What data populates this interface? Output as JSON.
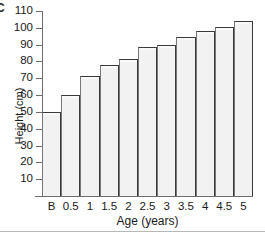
{
  "figure": {
    "panel_letter": "C",
    "background_color": "#ffffff"
  },
  "chart_data": {
    "type": "bar",
    "title": "",
    "xlabel": "Age (years)",
    "ylabel": "Height (cm)",
    "categories": [
      "B",
      "0.5",
      "1",
      "1.5",
      "2",
      "2.5",
      "3",
      "3.5",
      "4",
      "4.5",
      "5"
    ],
    "values": [
      50,
      60,
      71.5,
      78,
      81.5,
      88.5,
      89.5,
      94.5,
      98,
      100.5,
      104
    ],
    "ylim": [
      0,
      110
    ],
    "ytick_labels": [
      "110",
      "100",
      "90",
      "80",
      "70",
      "60",
      "50",
      "40",
      "30",
      "20",
      "10"
    ],
    "ytick_values": [
      110,
      100,
      90,
      80,
      70,
      60,
      50,
      40,
      30,
      20,
      10
    ],
    "grid": false,
    "legend": null,
    "bar_fill_color": "#f2f2f2",
    "bar_edge_color": "#3a3a3a",
    "axis_color": "#6d6d6d"
  }
}
